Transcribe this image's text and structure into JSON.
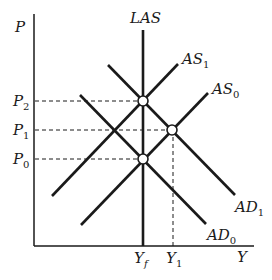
{
  "diagram": {
    "type": "AD-AS model",
    "axes": {
      "y_label": "P",
      "x_label": "Y"
    },
    "curves": {
      "las": {
        "label": "LAS"
      },
      "as1": {
        "label": "AS",
        "sub": "1"
      },
      "as0": {
        "label": "AS",
        "sub": "0"
      },
      "ad1": {
        "label": "AD",
        "sub": "1"
      },
      "ad0": {
        "label": "AD",
        "sub": "0"
      }
    },
    "price_levels": [
      {
        "label": "P",
        "sub": "2"
      },
      {
        "label": "P",
        "sub": "1"
      },
      {
        "label": "P",
        "sub": "0"
      }
    ],
    "output_levels": [
      {
        "label": "Y",
        "sub": "f"
      },
      {
        "label": "Y",
        "sub": "1"
      }
    ],
    "equilibria": [
      {
        "name": "P2-Yf",
        "desc": "AS1 ∩ AD1 ∩ LAS"
      },
      {
        "name": "P1-Y1",
        "desc": "AS0 ∩ AD1"
      },
      {
        "name": "P0-Yf",
        "desc": "AS0 ∩ AD0 ∩ LAS"
      }
    ]
  }
}
